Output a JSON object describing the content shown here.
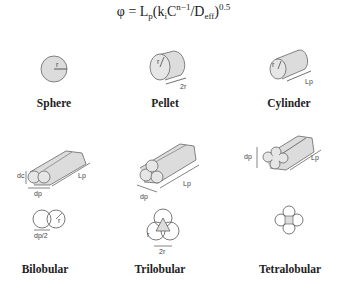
{
  "formula": {
    "phi": "φ = L",
    "p_sub": "p",
    "open": "(k",
    "k_sub": "i",
    "c": "C",
    "c_sup": "n−1",
    "slash_d": "/D",
    "d_sub": "eff",
    "close": ")",
    "exp": "0.5"
  },
  "shapes": [
    {
      "name": "Sphere",
      "dims": [
        "r"
      ]
    },
    {
      "name": "Pellet",
      "dims": [
        "r",
        "2r"
      ]
    },
    {
      "name": "Cylinder",
      "dims": [
        "r",
        "Lp"
      ]
    },
    {
      "name": "Bilobular",
      "dims": [
        "dc",
        "dp",
        "Lp",
        "r",
        "dp/2"
      ]
    },
    {
      "name": "Trilobular",
      "dims": [
        "dp",
        "Lp",
        "r",
        "2r"
      ]
    },
    {
      "name": "Tetralobular",
      "dims": [
        "dp",
        "Lp"
      ]
    }
  ],
  "colors": {
    "fill": "#dcdcdc",
    "stroke": "#555555"
  }
}
